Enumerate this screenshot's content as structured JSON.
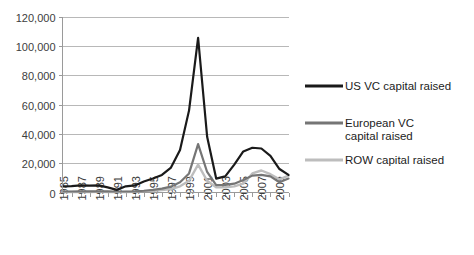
{
  "chart_data": {
    "type": "line",
    "title": "",
    "xlabel": "",
    "ylabel": "",
    "ylim": [
      0,
      120000
    ],
    "ytick_labels": [
      "120,000",
      "100,000",
      "80,000",
      "60,000",
      "40,000",
      "20,000",
      "0"
    ],
    "ytick_values": [
      120000,
      100000,
      80000,
      60000,
      40000,
      20000,
      0
    ],
    "grid": true,
    "legend_position": "right",
    "x": [
      1985,
      1986,
      1987,
      1988,
      1989,
      1990,
      1991,
      1992,
      1993,
      1994,
      1995,
      1996,
      1997,
      1998,
      1999,
      2000,
      2001,
      2002,
      2003,
      2004,
      2005,
      2006,
      2007,
      2008,
      2009,
      2010
    ],
    "xtick_labels": [
      "1985",
      "",
      "1987",
      "",
      "1989",
      "",
      "1991",
      "",
      "1993",
      "",
      "1995",
      "",
      "1997",
      "",
      "1999",
      "",
      "2001",
      "",
      "2003",
      "",
      "2005",
      "",
      "2007",
      "",
      "2009",
      ""
    ],
    "series": [
      {
        "name": "US VC capital raised",
        "color": "#1a1a1a",
        "width": 2.2,
        "values": [
          4200,
          4400,
          4800,
          4700,
          4900,
          3500,
          1800,
          4200,
          4800,
          7500,
          9500,
          12000,
          17000,
          29000,
          56000,
          105500,
          38000,
          9500,
          11000,
          19000,
          28000,
          30500,
          30000,
          25000,
          16000,
          12000
        ]
      },
      {
        "name": "European VC capital raised",
        "color": "#757575",
        "width": 2.2,
        "values": [
          600,
          650,
          700,
          750,
          800,
          700,
          500,
          600,
          800,
          1200,
          1800,
          2600,
          4000,
          7000,
          13000,
          33000,
          14000,
          5000,
          5200,
          6000,
          8500,
          11500,
          12000,
          11000,
          7000,
          9500
        ]
      },
      {
        "name": "ROW capital raised",
        "color": "#bdbdbd",
        "width": 2.4,
        "values": [
          300,
          320,
          350,
          380,
          400,
          380,
          300,
          350,
          450,
          700,
          1100,
          1600,
          2400,
          4200,
          8000,
          19000,
          8000,
          3500,
          3600,
          4200,
          6000,
          13000,
          15000,
          12500,
          9000,
          11500
        ]
      }
    ]
  },
  "legend": {
    "items": [
      {
        "label": "US VC capital raised"
      },
      {
        "label_line1": "European VC",
        "label_line2": "capital raised"
      },
      {
        "label": "ROW capital raised"
      }
    ]
  }
}
